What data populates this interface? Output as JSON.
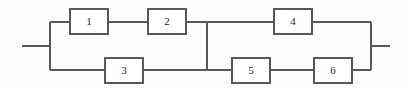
{
  "diagram": {
    "kind": "reliability-block-diagram",
    "title": "",
    "stroke_color": "#585858",
    "block_fill": "#ffffff",
    "background_color": "#fdfdfd",
    "blocks": [
      {
        "id": "block-1",
        "label": "1",
        "x": 70,
        "y": 9,
        "w": 38,
        "h": 25,
        "branch": "top-left"
      },
      {
        "id": "block-2",
        "label": "2",
        "x": 148,
        "y": 9,
        "w": 38,
        "h": 25,
        "branch": "top-left"
      },
      {
        "id": "block-3",
        "label": "3",
        "x": 105,
        "y": 58,
        "w": 38,
        "h": 25,
        "branch": "bottom-left"
      },
      {
        "id": "block-4",
        "label": "4",
        "x": 274,
        "y": 9,
        "w": 38,
        "h": 25,
        "branch": "top-right"
      },
      {
        "id": "block-5",
        "label": "5",
        "x": 232,
        "y": 58,
        "w": 38,
        "h": 25,
        "branch": "bottom-right"
      },
      {
        "id": "block-6",
        "label": "6",
        "x": 314,
        "y": 58,
        "w": 38,
        "h": 25,
        "branch": "bottom-right"
      }
    ],
    "nodes": {
      "input_terminal_x": 22,
      "output_terminal_x": 390,
      "main_line_y": 46,
      "top_rail_y": 22,
      "bottom_rail_y": 70,
      "left_bus_x": 50,
      "middle_bus_x": 207,
      "right_bus_x": 371
    },
    "wires": [
      {
        "name": "input-lead",
        "d": "M22,46 L50,46"
      },
      {
        "name": "left-bus",
        "d": "M50,22 L50,70"
      },
      {
        "name": "left-top-rail-to-b1",
        "d": "M50,22 L70,22"
      },
      {
        "name": "b1-to-b2",
        "d": "M108,22 L148,22"
      },
      {
        "name": "b2-to-middle-bus",
        "d": "M186,22 L207,22"
      },
      {
        "name": "left-bottom-rail-to-b3",
        "d": "M50,70 L105,70"
      },
      {
        "name": "b3-to-middle-bus",
        "d": "M143,70 L207,70"
      },
      {
        "name": "middle-bus",
        "d": "M207,22 L207,70"
      },
      {
        "name": "middle-bus-to-b4",
        "d": "M207,22 L274,22"
      },
      {
        "name": "b4-to-right-bus",
        "d": "M312,22 L371,22"
      },
      {
        "name": "middle-bus-to-b5",
        "d": "M207,70 L232,70"
      },
      {
        "name": "b5-to-b6",
        "d": "M270,70 L314,70"
      },
      {
        "name": "b6-to-right-bus",
        "d": "M352,70 L371,70"
      },
      {
        "name": "right-bus",
        "d": "M371,22 L371,70"
      },
      {
        "name": "output-lead",
        "d": "M371,46 L390,46"
      }
    ]
  }
}
